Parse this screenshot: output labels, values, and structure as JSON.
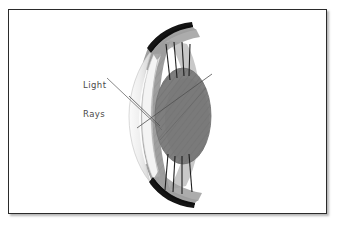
{
  "figure": {
    "kind": "anatomical-illustration",
    "frame": {
      "border_color": "#2b2b2b",
      "background_color": "#ffffff",
      "shadow_color": "#787878"
    },
    "annotations": [
      {
        "id": "light-rays",
        "line1": "Light",
        "line2": "Rays",
        "leader_from": [
          118,
          78
        ],
        "leader_to": [
          162,
          126
        ]
      }
    ],
    "palette": {
      "eyelid_black": "#141414",
      "sclera_gray": "#9a9a9a",
      "lens_gray": "#7e7e7e",
      "lens_shade": "#6e6e6e",
      "cornea_light": "#e8e8e8",
      "cornea_edge": "#bdbdbd",
      "ray_line": "#4f4f4f",
      "fiber_line": "#1f1f1f",
      "label_text": "#4a4a4a"
    },
    "parts": [
      {
        "name": "upper-eyelid",
        "tone": "#141414"
      },
      {
        "name": "lower-eyelid",
        "tone": "#141414"
      },
      {
        "name": "sclera",
        "tone": "#9a9a9a"
      },
      {
        "name": "cornea",
        "tone": "#e8e8e8"
      },
      {
        "name": "lens",
        "tone": "#7e7e7e"
      },
      {
        "name": "ciliary-fibers",
        "tone": "#1f1f1f"
      },
      {
        "name": "light-ray",
        "tone": "#4f4f4f"
      }
    ]
  }
}
